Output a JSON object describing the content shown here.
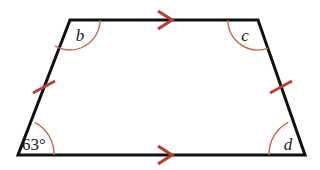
{
  "figure": {
    "shape_name": "isosceles-trapezoid",
    "background_color": "#ffffff",
    "outline_color": "#111111",
    "outline_width": 3,
    "marking_color": "#b8412c",
    "arc_color": "#c8674f",
    "vertices": {
      "top_left": {
        "x": 70,
        "y": 20
      },
      "top_right": {
        "x": 258,
        "y": 20
      },
      "bottom_right": {
        "x": 305,
        "y": 155
      },
      "bottom_left": {
        "x": 18,
        "y": 155
      }
    },
    "angles": [
      {
        "id": "angle-top-left",
        "vertex": "top_left",
        "label": "b",
        "label_style": "italic",
        "type": "obtuse",
        "arc_radius": 30
      },
      {
        "id": "angle-top-right",
        "vertex": "top_right",
        "label": "c",
        "label_style": "italic",
        "type": "obtuse",
        "arc_radius": 30
      },
      {
        "id": "angle-bottom-left",
        "vertex": "bottom_left",
        "label": "63°",
        "label_style": "normal",
        "type": "acute",
        "arc_radius": 36
      },
      {
        "id": "angle-bottom-right",
        "vertex": "bottom_right",
        "label": "d",
        "label_style": "italic",
        "type": "acute",
        "arc_radius": 36
      }
    ],
    "parallel_marks": [
      {
        "id": "arrow-top-edge",
        "edge": "top",
        "x": 165,
        "y": 20,
        "direction": "right",
        "count": 1
      },
      {
        "id": "arrow-bottom-edge",
        "edge": "bottom",
        "x": 165,
        "y": 155,
        "direction": "right",
        "count": 1
      }
    ],
    "congruence_marks": [
      {
        "id": "tick-left-leg",
        "edge": "left-leg",
        "x": 44,
        "y": 87,
        "count": 1
      },
      {
        "id": "tick-right-leg",
        "edge": "right-leg",
        "x": 281,
        "y": 87,
        "count": 1
      }
    ]
  }
}
